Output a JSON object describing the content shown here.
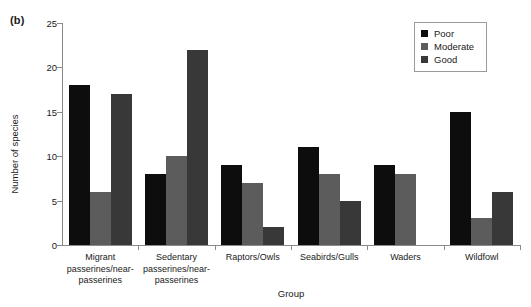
{
  "panel": {
    "label": "(b)"
  },
  "chart_data": {
    "type": "bar",
    "title": "",
    "xlabel": "Group",
    "ylabel": "Number of species",
    "ylim": [
      0,
      25
    ],
    "yticks": [
      0,
      5,
      10,
      15,
      20,
      25
    ],
    "grid": false,
    "legend_position": "top-right",
    "categories": [
      "Migrant passerines/near-passerines",
      "Sedentary passerines/near-passerines",
      "Raptors/Owls",
      "Seabirds/Gulls",
      "Waders",
      "Wildfowl"
    ],
    "series": [
      {
        "name": "Poor",
        "color": "#0d0d0d",
        "values": [
          18,
          8,
          9,
          11,
          9,
          15
        ]
      },
      {
        "name": "Moderate",
        "color": "#5c5c5c",
        "values": [
          6,
          10,
          7,
          8,
          8,
          3
        ]
      },
      {
        "name": "Good",
        "color": "#383838",
        "values": [
          17,
          22,
          2,
          5,
          null,
          6
        ]
      }
    ]
  },
  "category_lines": [
    [
      "Migrant",
      "passerines/near-",
      "passerines"
    ],
    [
      "Sedentary",
      "passerines/near-",
      "passerines"
    ],
    [
      "Raptors/Owls"
    ],
    [
      "Seabirds/Gulls"
    ],
    [
      "Waders"
    ],
    [
      "Wildfowl"
    ]
  ]
}
